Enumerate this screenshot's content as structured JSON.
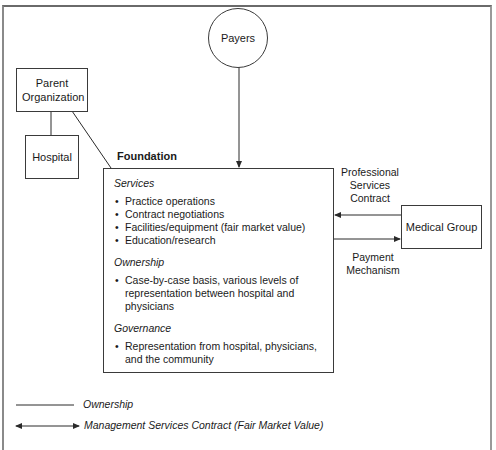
{
  "diagram": {
    "nodes": {
      "payers": "Payers",
      "parent_organization": "Parent Organization",
      "hospital": "Hospital",
      "medical_group": "Medical Group",
      "foundation": "Foundation"
    },
    "foundation_sections": [
      {
        "title": "Services",
        "items": [
          "Practice operations",
          "Contract negotiations",
          "Facilities/equipment (fair market value)",
          "Education/research"
        ]
      },
      {
        "title": "Ownership",
        "items": [
          "Case-by-case basis, various levels of representation between hospital and physicians"
        ]
      },
      {
        "title": "Governance",
        "items": [
          "Representation from hospital, physicians, and the community"
        ]
      }
    ],
    "edge_labels": {
      "professional_services": "Professional Services Contract",
      "payment": "Payment Mechanism"
    },
    "legend": [
      {
        "style": "line",
        "label": "Ownership"
      },
      {
        "style": "double-arrow",
        "label": "Management Services Contract (Fair Market Value)"
      }
    ]
  }
}
